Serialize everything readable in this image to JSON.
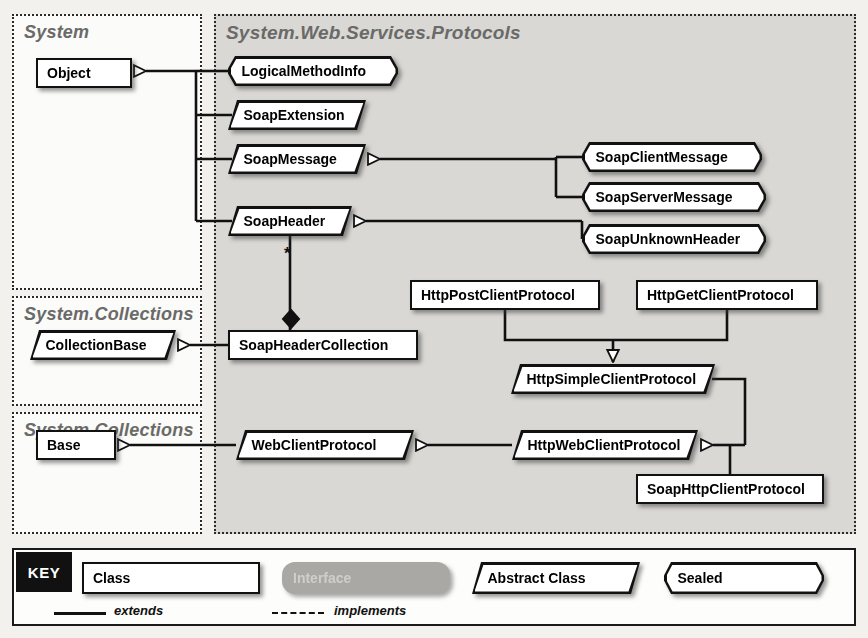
{
  "diagram": {
    "packages": [
      {
        "id": "system",
        "label": "System",
        "x": 12,
        "y": 14,
        "w": 190,
        "h": 276,
        "shaded": false
      },
      {
        "id": "collections1",
        "label": "System.Collections",
        "x": 12,
        "y": 296,
        "w": 190,
        "h": 110,
        "shaded": false
      },
      {
        "id": "collections2",
        "label": "System.Collections",
        "x": 12,
        "y": 412,
        "w": 190,
        "h": 122,
        "shaded": false
      },
      {
        "id": "protocols",
        "label": "System.Web.Services.Protocols",
        "x": 214,
        "y": 14,
        "w": 642,
        "h": 520,
        "shaded": true
      }
    ],
    "nodes": [
      {
        "id": "object",
        "label": "Object",
        "kind": "class",
        "x": 36,
        "y": 58,
        "w": 96,
        "h": 30
      },
      {
        "id": "collection-base",
        "label": "CollectionBase",
        "kind": "abstract",
        "x": 30,
        "y": 330,
        "w": 146,
        "h": 30
      },
      {
        "id": "base",
        "label": "Base",
        "kind": "class",
        "x": 36,
        "y": 430,
        "w": 80,
        "h": 30
      },
      {
        "id": "logical-method-info",
        "label": "LogicalMethodInfo",
        "kind": "sealed",
        "x": 228,
        "y": 56,
        "w": 170,
        "h": 30
      },
      {
        "id": "soap-extension",
        "label": "SoapExtension",
        "kind": "abstract",
        "x": 228,
        "y": 100,
        "w": 138,
        "h": 30
      },
      {
        "id": "soap-message",
        "label": "SoapMessage",
        "kind": "abstract",
        "x": 228,
        "y": 144,
        "w": 138,
        "h": 30
      },
      {
        "id": "soap-header",
        "label": "SoapHeader",
        "kind": "abstract",
        "x": 228,
        "y": 206,
        "w": 124,
        "h": 30
      },
      {
        "id": "soap-header-collection",
        "label": "SoapHeaderCollection",
        "kind": "class",
        "x": 228,
        "y": 330,
        "w": 190,
        "h": 30
      },
      {
        "id": "web-client-protocol",
        "label": "WebClientProtocol",
        "kind": "abstract",
        "x": 236,
        "y": 430,
        "w": 178,
        "h": 30
      },
      {
        "id": "soap-client-message",
        "label": "SoapClientMessage",
        "kind": "sealed",
        "x": 582,
        "y": 142,
        "w": 180,
        "h": 30
      },
      {
        "id": "soap-server-message",
        "label": "SoapServerMessage",
        "kind": "sealed",
        "x": 582,
        "y": 182,
        "w": 184,
        "h": 30
      },
      {
        "id": "soap-unknown-header",
        "label": "SoapUnknownHeader",
        "kind": "sealed",
        "x": 582,
        "y": 224,
        "w": 184,
        "h": 30
      },
      {
        "id": "http-post-client-protocol",
        "label": "HttpPostClientProtocol",
        "kind": "class",
        "x": 410,
        "y": 280,
        "w": 190,
        "h": 30
      },
      {
        "id": "http-get-client-protocol",
        "label": "HttpGetClientProtocol",
        "kind": "class",
        "x": 636,
        "y": 280,
        "w": 182,
        "h": 30
      },
      {
        "id": "http-simple-client-protocol",
        "label": "HttpSimpleClientProtocol",
        "kind": "abstract",
        "x": 511,
        "y": 364,
        "w": 204,
        "h": 30
      },
      {
        "id": "http-web-client-protocol",
        "label": "HttpWebClientProtocol",
        "kind": "abstract",
        "x": 512,
        "y": 430,
        "w": 186,
        "h": 30
      },
      {
        "id": "soap-http-client-protocol",
        "label": "SoapHttpClientProtocol",
        "kind": "class",
        "x": 636,
        "y": 474,
        "w": 188,
        "h": 30
      }
    ],
    "multiplicity": [
      {
        "id": "soap-header-multiplicity",
        "label": "*",
        "x": 284,
        "y": 244
      }
    ]
  },
  "key": {
    "badge": "KEY",
    "samples": [
      {
        "id": "class-sample",
        "label": "Class",
        "kind": "class"
      },
      {
        "id": "interface-sample",
        "label": "Interface",
        "kind": "interface"
      },
      {
        "id": "abstract-sample",
        "label": "Abstract Class",
        "kind": "abstract"
      },
      {
        "id": "sealed-sample",
        "label": "Sealed",
        "kind": "sealed"
      }
    ],
    "relations": [
      {
        "id": "extends-relation",
        "label": "extends",
        "style": "solid"
      },
      {
        "id": "implements-relation",
        "label": "implements",
        "style": "dashed"
      }
    ]
  },
  "colors": {
    "page_background": "#f2f1ee",
    "package_shaded": "#d9d8d4",
    "package_title": "#6a6a68",
    "node_fill": "#ffffff",
    "node_stroke": "#111111",
    "interface_fill": "#a9a8a5",
    "key_badge_background": "#111111",
    "key_badge_text": "#ffffff"
  }
}
